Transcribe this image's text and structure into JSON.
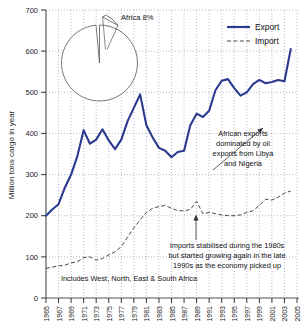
{
  "chart_data": {
    "type": "line",
    "title": "",
    "xlabel": "",
    "ylabel": "Million tons cargo in year",
    "xlim": [
      1965,
      2005
    ],
    "ylim": [
      0,
      700
    ],
    "ytick_step": 100,
    "grid": true,
    "legend_position": "top-right",
    "yticks": [
      "0",
      "100",
      "200",
      "300",
      "400",
      "500",
      "600",
      "700"
    ],
    "xticks": [
      "1965",
      "1967",
      "1969",
      "1971",
      "1973",
      "1975",
      "1977",
      "1979",
      "1981",
      "1983",
      "1985",
      "1987",
      "1989",
      "1991",
      "1993",
      "1995",
      "1997",
      "1999",
      "2001",
      "2003",
      "2005"
    ],
    "x": [
      1965,
      1966,
      1967,
      1968,
      1969,
      1970,
      1971,
      1972,
      1973,
      1974,
      1975,
      1976,
      1977,
      1978,
      1979,
      1980,
      1981,
      1982,
      1983,
      1984,
      1985,
      1986,
      1987,
      1988,
      1989,
      1990,
      1991,
      1992,
      1993,
      1994,
      1995,
      1996,
      1997,
      1998,
      1999,
      2000,
      2001,
      2002,
      2003,
      2004
    ],
    "series": [
      {
        "name": "Export",
        "style": "solid",
        "color": "#2b3a8f",
        "values": [
          200,
          215,
          228,
          268,
          300,
          345,
          408,
          375,
          385,
          410,
          383,
          362,
          385,
          430,
          462,
          495,
          420,
          390,
          365,
          358,
          342,
          355,
          358,
          420,
          448,
          440,
          455,
          505,
          528,
          532,
          510,
          492,
          500,
          520,
          530,
          522,
          525,
          530,
          527,
          605
        ]
      },
      {
        "name": "Import",
        "style": "dashed",
        "color": "#333333",
        "values": [
          72,
          75,
          78,
          80,
          85,
          88,
          98,
          100,
          92,
          96,
          105,
          112,
          125,
          148,
          170,
          190,
          208,
          218,
          222,
          225,
          218,
          212,
          212,
          215,
          235,
          205,
          208,
          205,
          202,
          200,
          200,
          202,
          208,
          212,
          225,
          240,
          238,
          245,
          255,
          260
        ]
      }
    ],
    "legend": [
      {
        "label": "Export",
        "style": "solid",
        "color": "#2b3a8f"
      },
      {
        "label": "Import",
        "style": "dashed",
        "color": "#333333"
      }
    ],
    "annotations": [
      {
        "name": "export-annotation",
        "lines": [
          "African exports",
          "dominated by oil",
          "exports from Libya",
          "and Nigeria"
        ]
      },
      {
        "name": "import-annotation",
        "lines": [
          "Imports stabilised during the 1980s",
          "but started growing again in the late",
          "1990s as the economy picked up"
        ]
      },
      {
        "name": "scope-note",
        "lines": [
          "Includes West, North, East & South Africa"
        ]
      }
    ],
    "inset_pie": {
      "type": "pie",
      "label": "Africa 8%",
      "slices": [
        {
          "label": "Africa",
          "value": 8,
          "exploded": true
        },
        {
          "label": "Rest of world",
          "value": 92,
          "exploded": false
        }
      ]
    }
  }
}
